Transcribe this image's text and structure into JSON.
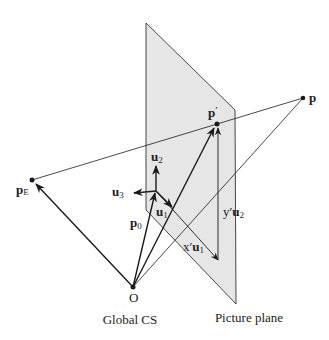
{
  "diagram": {
    "colors": {
      "background": "#ffffff",
      "plane_fill": "#e6e6e6",
      "line": "#1a1a1a",
      "text": "#222222"
    },
    "captions": {
      "global_cs": "Global CS",
      "picture_plane": "Picture plane"
    },
    "points": {
      "origin": {
        "label": "O"
      },
      "eye": {
        "label": "p",
        "sub": "E"
      },
      "point": {
        "label": "p"
      },
      "projected": {
        "label": "p",
        "prime": "′"
      }
    },
    "vectors": {
      "p0": {
        "label": "p",
        "sub": "0"
      },
      "u1": {
        "label": "u",
        "sub": "1"
      },
      "u2": {
        "label": "u",
        "sub": "2"
      },
      "u3": {
        "label": "u",
        "sub": "3"
      },
      "xu1": {
        "coef": "x′",
        "label": "u",
        "sub": "1"
      },
      "yu2": {
        "coef": "y′",
        "label": "u",
        "sub": "2"
      }
    }
  }
}
